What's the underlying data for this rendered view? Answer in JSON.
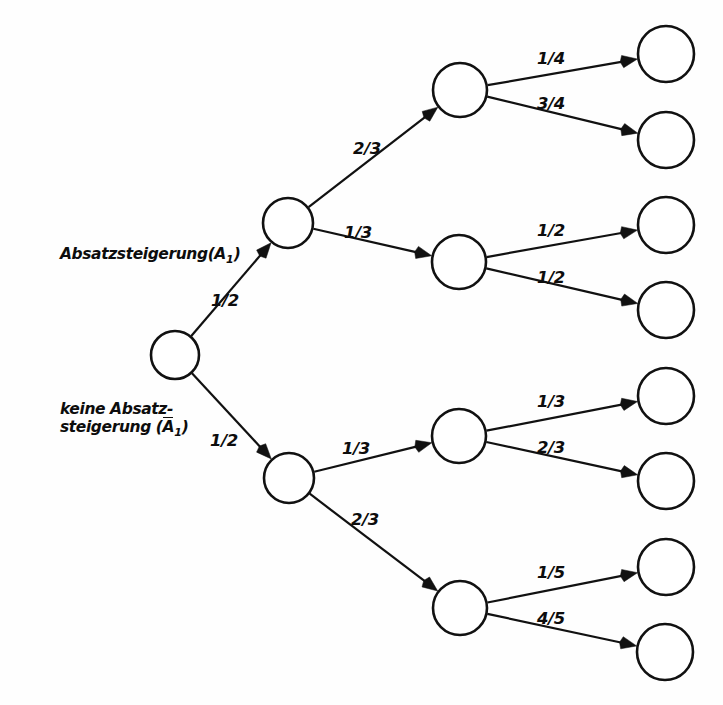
{
  "diagram": {
    "type": "probability-tree",
    "stroke_color": "#111111",
    "fill_color": "#ffffff",
    "background": "#ffffff"
  },
  "state_labels": [
    {
      "id": "label-absatzsteigerung",
      "text_main": "Absatzsteigerung(A",
      "text_sub": "1",
      "text_tail": ")",
      "full_text": "Absatzsteigerung(A1)",
      "overline": false,
      "x": 60,
      "y": 245
    },
    {
      "id": "label-keine-absatzsteigerung",
      "line1": "keine Absatz-",
      "line2_pre": "steigerung (",
      "line2_over": "A",
      "line2_sub": "1",
      "line2_tail": ")",
      "full_text": "keine Absatz-steigerung (Ā1)",
      "overline": true,
      "x": 60,
      "y": 400
    }
  ],
  "nodes": [
    {
      "id": "root",
      "name": "root-node",
      "cx": 175,
      "cy": 355,
      "r": 24
    },
    {
      "id": "n1a",
      "name": "level1-node-up",
      "cx": 288,
      "cy": 223,
      "r": 25
    },
    {
      "id": "n1b",
      "name": "level1-node-down",
      "cx": 289,
      "cy": 478,
      "r": 25
    },
    {
      "id": "n2a",
      "name": "level2-node-1",
      "cx": 460,
      "cy": 90,
      "r": 27
    },
    {
      "id": "n2b",
      "name": "level2-node-2",
      "cx": 459,
      "cy": 262,
      "r": 27
    },
    {
      "id": "n2c",
      "name": "level2-node-3",
      "cx": 459,
      "cy": 436,
      "r": 27
    },
    {
      "id": "n2d",
      "name": "level2-node-4",
      "cx": 460,
      "cy": 608,
      "r": 27
    },
    {
      "id": "l1",
      "name": "leaf-node-1",
      "cx": 666,
      "cy": 54,
      "r": 28
    },
    {
      "id": "l2",
      "name": "leaf-node-2",
      "cx": 666,
      "cy": 140,
      "r": 28
    },
    {
      "id": "l3",
      "name": "leaf-node-3",
      "cx": 666,
      "cy": 225,
      "r": 28
    },
    {
      "id": "l4",
      "name": "leaf-node-4",
      "cx": 666,
      "cy": 310,
      "r": 28
    },
    {
      "id": "l5",
      "name": "leaf-node-5",
      "cx": 666,
      "cy": 396,
      "r": 28
    },
    {
      "id": "l6",
      "name": "leaf-node-6",
      "cx": 666,
      "cy": 481,
      "r": 28
    },
    {
      "id": "l7",
      "name": "leaf-node-7",
      "cx": 666,
      "cy": 567,
      "r": 28
    },
    {
      "id": "l8",
      "name": "leaf-node-8",
      "cx": 665,
      "cy": 652,
      "r": 28
    }
  ],
  "edges": [
    {
      "id": "e-root-n1a",
      "name": "edge-root-to-level1-up",
      "from": "root",
      "to": "n1a",
      "label": "1/2",
      "lx": 225,
      "ly": 300
    },
    {
      "id": "e-root-n1b",
      "name": "edge-root-to-level1-down",
      "from": "root",
      "to": "n1b",
      "label": "1/2",
      "lx": 224,
      "ly": 440
    },
    {
      "id": "e-n1a-n2a",
      "name": "edge-level1up-to-node1",
      "from": "n1a",
      "to": "n2a",
      "label": "2/3",
      "lx": 367,
      "ly": 148
    },
    {
      "id": "e-n1a-n2b",
      "name": "edge-level1up-to-node2",
      "from": "n1a",
      "to": "n2b",
      "label": "1/3",
      "lx": 358,
      "ly": 232
    },
    {
      "id": "e-n1b-n2c",
      "name": "edge-level1down-to-node3",
      "from": "n1b",
      "to": "n2c",
      "label": "1/3",
      "lx": 356,
      "ly": 448
    },
    {
      "id": "e-n1b-n2d",
      "name": "edge-level1down-to-node4",
      "from": "n1b",
      "to": "n2d",
      "label": "2/3",
      "lx": 365,
      "ly": 519
    },
    {
      "id": "e-n2a-l1",
      "name": "edge-node1-to-leaf1",
      "from": "n2a",
      "to": "l1",
      "label": "1/4",
      "lx": 551,
      "ly": 58
    },
    {
      "id": "e-n2a-l2",
      "name": "edge-node1-to-leaf2",
      "from": "n2a",
      "to": "l2",
      "label": "3/4",
      "lx": 551,
      "ly": 103
    },
    {
      "id": "e-n2b-l3",
      "name": "edge-node2-to-leaf3",
      "from": "n2b",
      "to": "l3",
      "label": "1/2",
      "lx": 551,
      "ly": 230
    },
    {
      "id": "e-n2b-l4",
      "name": "edge-node2-to-leaf4",
      "from": "n2b",
      "to": "l4",
      "label": "1/2",
      "lx": 551,
      "ly": 277
    },
    {
      "id": "e-n2c-l5",
      "name": "edge-node3-to-leaf5",
      "from": "n2c",
      "to": "l5",
      "label": "1/3",
      "lx": 551,
      "ly": 401
    },
    {
      "id": "e-n2c-l6",
      "name": "edge-node3-to-leaf6",
      "from": "n2c",
      "to": "l6",
      "label": "2/3",
      "lx": 551,
      "ly": 447
    },
    {
      "id": "e-n2d-l7",
      "name": "edge-node4-to-leaf7",
      "from": "n2d",
      "to": "l7",
      "label": "1/5",
      "lx": 551,
      "ly": 572
    },
    {
      "id": "e-n2d-l8",
      "name": "edge-node4-to-leaf8",
      "from": "n2d",
      "to": "l8",
      "label": "4/5",
      "lx": 551,
      "ly": 618
    }
  ],
  "chart_data": {
    "type": "tree",
    "levels": 3,
    "root_branches": [
      {
        "label": "Absatzsteigerung(A1)",
        "probability": "1/2",
        "children": [
          {
            "probability": "2/3",
            "children": [
              {
                "probability": "1/4"
              },
              {
                "probability": "3/4"
              }
            ]
          },
          {
            "probability": "1/3",
            "children": [
              {
                "probability": "1/2"
              },
              {
                "probability": "1/2"
              }
            ]
          }
        ]
      },
      {
        "label": "keine Absatz-steigerung (Ā1)",
        "probability": "1/2",
        "children": [
          {
            "probability": "1/3",
            "children": [
              {
                "probability": "1/3"
              },
              {
                "probability": "2/3"
              }
            ]
          },
          {
            "probability": "2/3",
            "children": [
              {
                "probability": "1/5"
              },
              {
                "probability": "4/5"
              }
            ]
          }
        ]
      }
    ]
  }
}
